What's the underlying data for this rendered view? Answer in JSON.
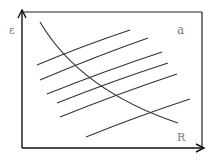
{
  "diagram": {
    "y_axis_label": "ε",
    "x_axis_label": "R",
    "panel_label": "a",
    "frame": {
      "x1": 22,
      "y1": 12,
      "x2": 202,
      "y2": 148
    },
    "decreasing_curve": "M40,22 Q80,90 178,123",
    "increasing_lines": [
      {
        "x1": 37,
        "y1": 65,
        "x2": 130,
        "y2": 30
      },
      {
        "x1": 40,
        "y1": 80,
        "x2": 148,
        "y2": 38
      },
      {
        "x1": 47,
        "y1": 94,
        "x2": 162,
        "y2": 52
      },
      {
        "x1": 57,
        "y1": 103,
        "x2": 168,
        "y2": 63
      },
      {
        "x1": 60,
        "y1": 117,
        "x2": 177,
        "y2": 74
      },
      {
        "x1": 86,
        "y1": 137,
        "x2": 190,
        "y2": 99
      }
    ],
    "colors": {
      "line": "#333333",
      "frame": "#222222",
      "label": "#777777"
    }
  }
}
